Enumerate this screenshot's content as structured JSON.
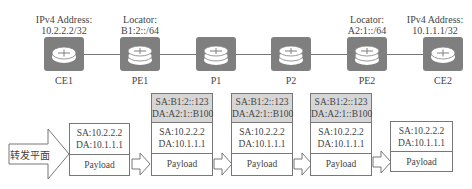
{
  "topology": {
    "nodes": [
      {
        "id": "CE1",
        "name": "CE1",
        "type": "ce-router",
        "annotation": [
          "IPv4 Address:",
          "10.2.2.2/32"
        ]
      },
      {
        "id": "PE1",
        "name": "PE1",
        "type": "pe-router",
        "annotation": [
          "Locator:",
          "B1:2::/64"
        ]
      },
      {
        "id": "P1",
        "name": "P1",
        "type": "p-router",
        "annotation": []
      },
      {
        "id": "P2",
        "name": "P2",
        "type": "p-router",
        "annotation": []
      },
      {
        "id": "PE2",
        "name": "PE2",
        "type": "pe-router",
        "annotation": [
          "Locator:",
          "A2:1::/64"
        ]
      },
      {
        "id": "CE2",
        "name": "CE2",
        "type": "ce-router",
        "annotation": [
          "IPv4 Address:",
          "10.1.1.1/32"
        ]
      }
    ],
    "links": [
      [
        "CE1",
        "PE1"
      ],
      [
        "PE1",
        "P1"
      ],
      [
        "P1",
        "P2"
      ],
      [
        "P2",
        "PE2"
      ],
      [
        "PE2",
        "CE2"
      ]
    ]
  },
  "forwarding": {
    "plane_label": "转发平面",
    "packets": [
      {
        "outer": null,
        "inner": {
          "sa": "SA:10.2.2.2",
          "da": "DA:10.1.1.1"
        },
        "payload": "Payload"
      },
      {
        "outer": {
          "sa": "SA:B1:2::123",
          "da": "DA:A2:1::B100"
        },
        "inner": {
          "sa": "SA:10.2.2.2",
          "da": "DA:10.1.1.1"
        },
        "payload": "Payload"
      },
      {
        "outer": {
          "sa": "SA:B1:2::123",
          "da": "DA:A2:1::B100"
        },
        "inner": {
          "sa": "SA:10.2.2.2",
          "da": "DA:10.1.1.1"
        },
        "payload": "Payload"
      },
      {
        "outer": {
          "sa": "SA:B1:2::123",
          "da": "DA:A2:1::B100"
        },
        "inner": {
          "sa": "SA:10.2.2.2",
          "da": "DA:10.1.1.1"
        },
        "payload": "Payload"
      },
      {
        "outer": null,
        "inner": {
          "sa": "SA:10.2.2.2",
          "da": "DA:10.1.1.1"
        },
        "payload": "Payload"
      }
    ]
  },
  "colors": {
    "router_fill": "#7f7f7f",
    "outer_header_fill": "#d6d6d6",
    "line": "#777777"
  }
}
